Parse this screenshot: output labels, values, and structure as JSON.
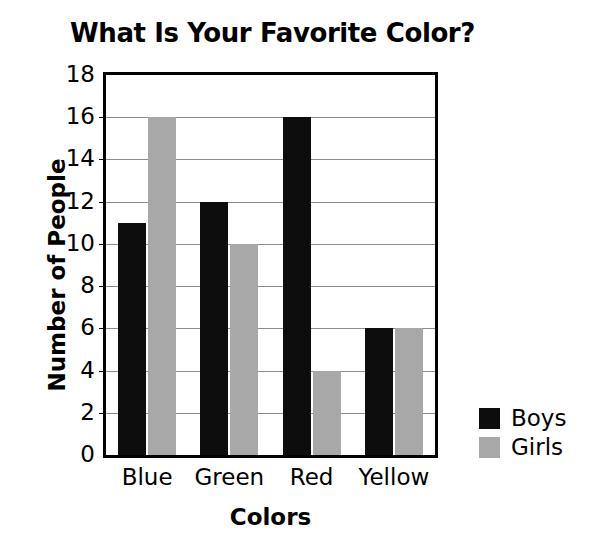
{
  "chart_data": {
    "type": "bar",
    "title": "What Is Your Favorite Color?",
    "xlabel": "Colors",
    "ylabel": "Number of People",
    "categories": [
      "Blue",
      "Green",
      "Red",
      "Yellow"
    ],
    "series": [
      {
        "name": "Boys",
        "color": "#0d0d0d",
        "values": [
          11,
          12,
          16,
          6
        ]
      },
      {
        "name": "Girls",
        "color": "#a8a8a8",
        "values": [
          16,
          10,
          4,
          6
        ]
      }
    ],
    "ylim": [
      0,
      18
    ],
    "ytick_step": 2,
    "yticks": [
      "0",
      "2",
      "4",
      "6",
      "8",
      "10",
      "12",
      "14",
      "16",
      "18"
    ],
    "grid": true,
    "legend_position": "right"
  }
}
